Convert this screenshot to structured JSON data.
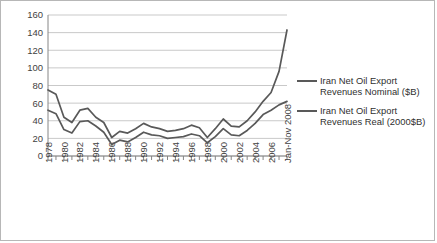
{
  "chart_data": {
    "type": "line",
    "title": "",
    "xlabel": "",
    "ylabel": "",
    "ylim": [
      0,
      160
    ],
    "ytick_step": 20,
    "grid": true,
    "legend_position": "right",
    "ytick_labels": [
      "160",
      "140",
      "120",
      "100",
      "80",
      "60",
      "40",
      "20",
      "0"
    ],
    "categories": [
      "1978",
      "1979",
      "1980",
      "1981",
      "1982",
      "1983",
      "1984",
      "1985",
      "1986",
      "1987",
      "1988",
      "1989",
      "1990",
      "1991",
      "1992",
      "1993",
      "1994",
      "1995",
      "1996",
      "1997",
      "1998",
      "1999",
      "2000",
      "2001",
      "2002",
      "2003",
      "2004",
      "2005",
      "2006",
      "2007",
      "Jan-Nov 2008"
    ],
    "xtick_labels_shown": [
      "1978",
      "1980",
      "1982",
      "1984",
      "1986",
      "1988",
      "1990",
      "1992",
      "1994",
      "1996",
      "1998",
      "2000",
      "2002",
      "2004",
      "2006",
      "Jan-Nov 2008"
    ],
    "series": [
      {
        "name": "Iran Net Oil Export Revenues Nominal ($B)",
        "color": "#595959",
        "values": [
          20,
          19,
          13,
          12,
          19,
          20,
          17,
          14,
          7,
          10,
          9,
          12,
          17,
          15,
          15,
          13,
          14,
          15,
          18,
          16,
          10,
          16,
          24,
          19,
          19,
          25,
          34,
          45,
          54,
          68,
          143
        ]
      },
      {
        "name": "Iran Net Oil Export Revenues Real (2000$B)",
        "color": "#595959",
        "values": [
          52,
          48,
          30,
          26,
          39,
          40,
          34,
          27,
          13,
          18,
          16,
          21,
          27,
          24,
          23,
          20,
          21,
          22,
          25,
          23,
          15,
          22,
          31,
          24,
          23,
          29,
          37,
          47,
          52,
          58,
          62
        ]
      }
    ],
    "series_drawn_order": [
      "nominal_upper",
      "real_lower"
    ],
    "upper_line_values": [
      75,
      70,
      44,
      38,
      52,
      54,
      44,
      38,
      21,
      28,
      26,
      31,
      37,
      33,
      31,
      28,
      29,
      31,
      35,
      32,
      21,
      31,
      42,
      34,
      33,
      40,
      50,
      62,
      72,
      96,
      143
    ],
    "lower_line_values": [
      52,
      48,
      30,
      26,
      39,
      40,
      34,
      27,
      13,
      18,
      16,
      21,
      27,
      24,
      23,
      20,
      21,
      22,
      25,
      23,
      15,
      22,
      31,
      24,
      23,
      29,
      37,
      47,
      52,
      58,
      62
    ]
  },
  "legend": {
    "entries": [
      {
        "label": "Iran Net Oil Export Revenues Nominal ($B)",
        "color": "#595959"
      },
      {
        "label": "Iran Net Oil Export Revenues Real (2000$B)",
        "color": "#595959"
      }
    ]
  },
  "colors": {
    "frame_border": "#b7b7b7",
    "gridline": "#c9c9c9",
    "axis": "#868686",
    "line": "#595959",
    "tick_text": "#3f3f3f",
    "background": "#ffffff"
  }
}
